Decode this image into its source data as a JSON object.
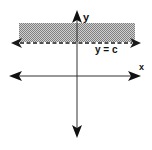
{
  "diagram": {
    "type": "coordinate-plane-inequality",
    "axes": {
      "x_label": "x",
      "y_label": "y"
    },
    "boundary": {
      "label": "y = c",
      "style": "dashed",
      "orientation": "horizontal"
    },
    "region": {
      "shaded": "above boundary",
      "fill_pattern": "gray checker"
    },
    "colors": {
      "axis": "#1a1a1a",
      "shade": "#a8a8a8",
      "background": "#ffffff"
    }
  }
}
